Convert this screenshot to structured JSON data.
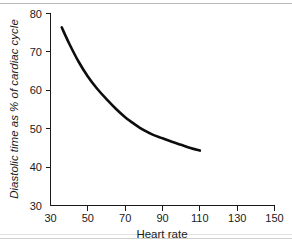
{
  "chart_data": {
    "type": "line",
    "title": "",
    "subtitle": "",
    "xlabel": "Heart rate",
    "ylabel": "Diastolic time as % of cardiac cycle",
    "xlim": [
      30,
      150
    ],
    "ylim": [
      30,
      80
    ],
    "xticks": [
      30,
      50,
      70,
      90,
      110,
      130,
      150
    ],
    "yticks": [
      30,
      40,
      50,
      60,
      70,
      80
    ],
    "xtick_labels": [
      "30",
      "50",
      "70",
      "90",
      "110",
      "130",
      "150"
    ],
    "ytick_labels": [
      "30",
      "40",
      "50",
      "60",
      "70",
      "80"
    ],
    "grid": false,
    "legend": null,
    "annotations": [],
    "series": [
      {
        "name": "Diastolic time",
        "color": "#0d0d0d",
        "line_width": 2.6,
        "x": [
          36,
          40,
          45,
          50,
          55,
          60,
          65,
          70,
          75,
          80,
          85,
          90,
          95,
          100,
          105,
          110
        ],
        "values": [
          76.4,
          72.2,
          67.5,
          63.6,
          60.4,
          57.7,
          55.2,
          53.0,
          51.2,
          49.6,
          48.4,
          47.5,
          46.6,
          45.8,
          45.0,
          44.3
        ]
      }
    ]
  },
  "axes": {
    "x_axis_label": "Heart rate",
    "y_axis_label": "Diastolic time as % of cardiac cycle"
  },
  "tick_text": {
    "y": {
      "t80": "80",
      "t70": "70",
      "t60": "60",
      "t50": "50",
      "t40": "40",
      "t30": "30"
    },
    "x": {
      "t30": "30",
      "t50": "50",
      "t70": "70",
      "t90": "90",
      "t110": "110",
      "t130": "130",
      "t150": "150"
    }
  },
  "colors": {
    "curve": "#0d0d0d",
    "axis": "#1a1a1a",
    "background": "#ffffff",
    "scan_artifact": "#b9b9b9"
  }
}
